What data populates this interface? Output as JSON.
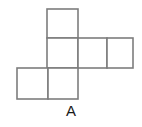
{
  "figure": {
    "label": "A",
    "kind": "cube-net",
    "stroke_color": "#7d7d7d",
    "fill_color": "#ffffff",
    "background_color": "#ffffff",
    "stroke_width": 1.6,
    "cell_size": 30,
    "origin": {
      "x": 17,
      "y": 9
    },
    "grid_columns": 4,
    "grid_rows": 3,
    "cells": [
      {
        "name": "top-square",
        "col": 1,
        "row": 0,
        "x": 47,
        "y": 9,
        "w": 31,
        "h": 29
      },
      {
        "name": "middle-left-square",
        "col": 1,
        "row": 1,
        "x": 47,
        "y": 38,
        "w": 31,
        "h": 30
      },
      {
        "name": "middle-center-square",
        "col": 2,
        "row": 1,
        "x": 78,
        "y": 38,
        "w": 29,
        "h": 30
      },
      {
        "name": "middle-right-square",
        "col": 3,
        "row": 1,
        "x": 107,
        "y": 38,
        "w": 26,
        "h": 30
      },
      {
        "name": "bottom-left-square",
        "col": 0,
        "row": 2,
        "x": 17,
        "y": 68,
        "w": 31,
        "h": 31
      },
      {
        "name": "bottom-center-square",
        "col": 1,
        "row": 2,
        "x": 48,
        "y": 68,
        "w": 30,
        "h": 31
      }
    ]
  }
}
